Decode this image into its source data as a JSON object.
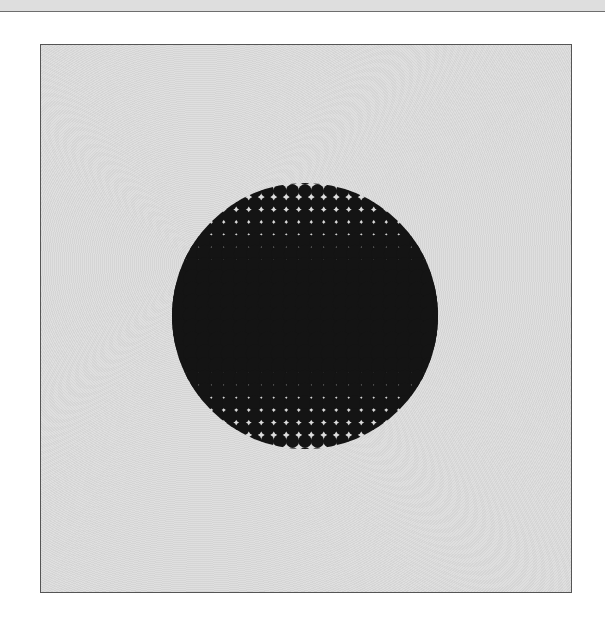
{
  "artwork": {
    "type": "halftone-circle",
    "colors": {
      "page_background": "#ffffff",
      "panel_background": "#dcdcdc",
      "panel_border": "#555555",
      "ink": "#141414",
      "top_strip": "#dedede"
    },
    "panel": {
      "x": 40,
      "y": 44,
      "width": 532,
      "height": 549
    },
    "circle": {
      "cx": 305,
      "cy": 316,
      "r": 133
    },
    "grid_spacing": 12.5
  }
}
